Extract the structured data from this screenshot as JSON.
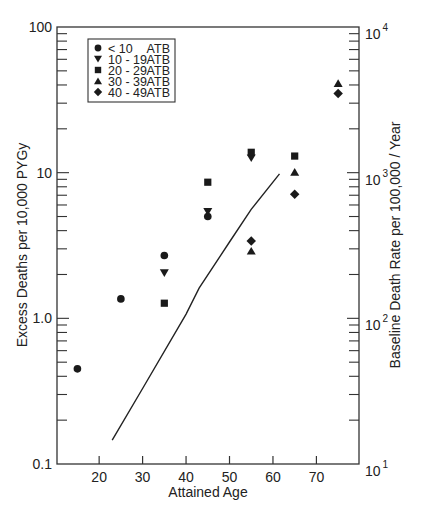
{
  "chart_data": {
    "type": "scatter",
    "title": "",
    "xlabel": "Attained Age",
    "ylabel": "Excess Deaths per 10,000 PYGy",
    "y2label": "Baseline Death Rate per 100,000 / Year",
    "xlim": [
      10.3,
      79.8
    ],
    "ylim": [
      0.1,
      100
    ],
    "y2lim": [
      10,
      10000
    ],
    "yscale": "log",
    "grid": false,
    "legend_position": "upper left",
    "x_ticks": [
      20,
      30,
      40,
      50,
      60,
      70
    ],
    "x_tick_labels": [
      "20",
      "30",
      "40",
      "50",
      "60",
      "70"
    ],
    "y_ticks": [
      0.1,
      1.0,
      10,
      100
    ],
    "y_tick_labels": [
      "0.1",
      "1.0",
      "10",
      "100"
    ],
    "y2_ticks": [
      10,
      100,
      1000,
      10000
    ],
    "y2_tick_labels": [
      {
        "base": "10",
        "exp": "1"
      },
      {
        "base": "10",
        "exp": "2"
      },
      {
        "base": "10",
        "exp": "3"
      },
      {
        "base": "10",
        "exp": "4"
      }
    ],
    "series": [
      {
        "name": "< 10 ATB",
        "label_left": "< 10",
        "label_right": "ATB",
        "marker": "circle",
        "points": [
          [
            15,
            0.45
          ],
          [
            25,
            1.36
          ],
          [
            35,
            2.7
          ],
          [
            45,
            5.0
          ]
        ]
      },
      {
        "name": "10 - 19 ATB",
        "label_left": "10 - 19",
        "label_right": "ATB",
        "marker": "triangle-down",
        "points": [
          [
            35,
            2.05
          ],
          [
            45,
            5.4
          ],
          [
            55,
            12.6
          ]
        ]
      },
      {
        "name": "20 - 29 ATB",
        "label_left": "20 - 29",
        "label_right": "ATB",
        "marker": "square",
        "points": [
          [
            35,
            1.27
          ],
          [
            45,
            8.6
          ],
          [
            55,
            13.8
          ],
          [
            65,
            13.0
          ]
        ]
      },
      {
        "name": "30 - 39 ATB",
        "label_left": "30 - 39",
        "label_right": "ATB",
        "marker": "triangle-up",
        "points": [
          [
            55,
            2.9
          ],
          [
            65,
            10.1
          ],
          [
            75,
            41
          ]
        ]
      },
      {
        "name": "40 - 49 ATB",
        "label_left": "40 - 49",
        "label_right": "ATB",
        "marker": "diamond",
        "points": [
          [
            55,
            3.4
          ],
          [
            65,
            7.1
          ],
          [
            75,
            35
          ]
        ]
      }
    ],
    "baseline_curve": {
      "name": "Baseline death rate",
      "axis": "right",
      "points": [
        [
          23,
          14.6
        ],
        [
          30,
          33
        ],
        [
          40,
          107
        ],
        [
          43,
          161
        ],
        [
          50,
          334
        ],
        [
          55,
          560
        ],
        [
          61.5,
          980
        ]
      ]
    }
  }
}
